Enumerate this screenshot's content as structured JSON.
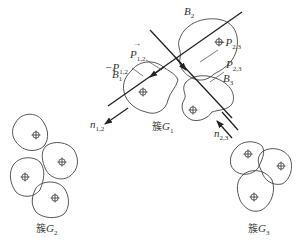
{
  "clusters": [
    {
      "id": "G1",
      "label_prefix": "簇",
      "label_var": "G",
      "label_sub": "1",
      "particle_count": 3
    },
    {
      "id": "G2",
      "label_prefix": "簇",
      "label_var": "G",
      "label_sub": "2",
      "particle_count": 4
    },
    {
      "id": "G3",
      "label_prefix": "簇",
      "label_var": "G",
      "label_sub": "3",
      "particle_count": 3
    }
  ],
  "particles": {
    "B1": {
      "var": "B",
      "sub": "1"
    },
    "B2": {
      "var": "B",
      "sub": "2"
    },
    "B3": {
      "var": "B",
      "sub": "3"
    }
  },
  "vectors": {
    "P12": {
      "sign": "",
      "var": "P",
      "sub": "1,2"
    },
    "neg_P12": {
      "sign": "−",
      "var": "P",
      "sub": "1,2"
    },
    "P23": {
      "sign": "",
      "var": "P",
      "sub": "2,3"
    },
    "neg_P23": {
      "sign": "−",
      "var": "P",
      "sub": "2,3"
    },
    "n12": {
      "var": "n",
      "sub": "1,2"
    },
    "n23": {
      "var": "n",
      "sub": "2,3"
    }
  },
  "center_marker": "⊕",
  "colors": {
    "stroke": "#444444",
    "line": "#222222",
    "text": "#333333"
  }
}
